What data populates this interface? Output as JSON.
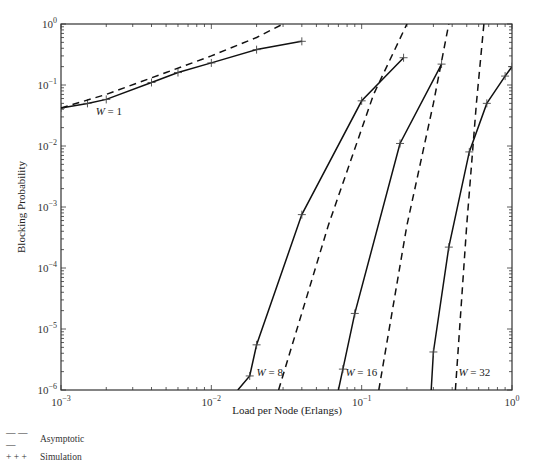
{
  "chart_data": {
    "type": "line",
    "title": "",
    "xlabel": "Load per Node (Erlangs)",
    "ylabel": "Blocking Probability",
    "xscale": "log",
    "yscale": "log",
    "xlim": [
      0.001,
      1
    ],
    "ylim": [
      1e-06,
      1
    ],
    "x_ticks": [
      "10^-3",
      "10^-2",
      "10^-1",
      "10^0"
    ],
    "y_ticks": [
      "10^0",
      "10^-1",
      "10^-2",
      "10^-3",
      "10^-4",
      "10^-5",
      "10^-6"
    ],
    "grid": false,
    "legend": {
      "position": "below-left",
      "entries": [
        {
          "symbol": "— — —",
          "label": "Asymptotic",
          "style": "dashed"
        },
        {
          "symbol": "+ + +",
          "label": "Simulation",
          "style": "solid-with-plus-markers"
        }
      ]
    },
    "series": [
      {
        "name": "W = 1 Simulation",
        "style": "solid",
        "markers": true,
        "x": [
          0.001,
          0.0015,
          0.002,
          0.004,
          0.006,
          0.01,
          0.02,
          0.04
        ],
        "y": [
          0.042,
          0.05,
          0.058,
          0.11,
          0.16,
          0.23,
          0.38,
          0.52
        ]
      },
      {
        "name": "W = 1 Asymptotic",
        "style": "dashed",
        "markers": false,
        "x": [
          0.001,
          0.002,
          0.005,
          0.01,
          0.02,
          0.03
        ],
        "y": [
          0.042,
          0.07,
          0.16,
          0.3,
          0.6,
          1.0
        ]
      },
      {
        "name": "W = 8 Simulation",
        "style": "solid",
        "markers": true,
        "x": [
          0.015,
          0.018,
          0.02,
          0.04,
          0.1,
          0.19
        ],
        "y": [
          1e-06,
          1.7e-06,
          5.5e-06,
          0.00075,
          0.055,
          0.28
        ]
      },
      {
        "name": "W = 8 Asymptotic",
        "style": "dashed",
        "markers": false,
        "x": [
          0.028,
          0.06,
          0.12,
          0.2
        ],
        "y": [
          1e-06,
          0.0005,
          0.07,
          1.0
        ]
      },
      {
        "name": "W = 16 Simulation",
        "style": "solid",
        "markers": true,
        "x": [
          0.07,
          0.075,
          0.09,
          0.18,
          0.34
        ],
        "y": [
          1e-06,
          2.2e-06,
          1.8e-05,
          0.011,
          0.22
        ]
      },
      {
        "name": "W = 16 Asymptotic",
        "style": "dashed",
        "markers": false,
        "x": [
          0.13,
          0.2,
          0.3,
          0.38
        ],
        "y": [
          1e-06,
          0.0005,
          0.05,
          1.0
        ]
      },
      {
        "name": "W = 32 Simulation",
        "style": "solid",
        "markers": true,
        "x": [
          0.29,
          0.3,
          0.38,
          0.52,
          0.68,
          0.9,
          1.0
        ],
        "y": [
          1e-06,
          4.2e-06,
          0.00022,
          0.008,
          0.05,
          0.14,
          0.2
        ]
      },
      {
        "name": "W = 32 Asymptotic",
        "style": "dashed",
        "markers": false,
        "x": [
          0.42,
          0.5,
          0.58,
          0.65
        ],
        "y": [
          1e-06,
          0.0005,
          0.05,
          1.0
        ]
      }
    ],
    "annotations": [
      {
        "text": "W = 1",
        "x": 0.0017,
        "y": 0.032
      },
      {
        "text": "W = 8",
        "x": 0.02,
        "y": 1.7e-06
      },
      {
        "text": "W = 16",
        "x": 0.078,
        "y": 1.7e-06
      },
      {
        "text": "W = 32",
        "x": 0.44,
        "y": 1.7e-06
      }
    ]
  },
  "labels": {
    "xlabel": "Load per Node (Erlangs)",
    "ylabel": "Blocking Probability",
    "legend_asymptotic_symbol": "— — —",
    "legend_asymptotic": "Asymptotic",
    "legend_simulation_symbol": "+ + +",
    "legend_simulation": "Simulation"
  }
}
